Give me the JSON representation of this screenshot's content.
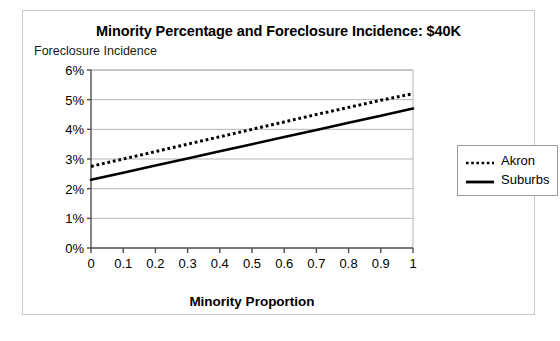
{
  "chart_data": {
    "type": "line",
    "title": "Minority Percentage and Foreclosure Incidence: $40K",
    "xlabel": "Minority Proportion",
    "ylabel": "Foreclosure Incidence",
    "x": [
      0,
      0.1,
      0.2,
      0.3,
      0.4,
      0.5,
      0.6,
      0.7,
      0.8,
      0.9,
      1
    ],
    "xtick_labels": [
      "0",
      "0.1",
      "0.2",
      "0.3",
      "0.4",
      "0.5",
      "0.6",
      "0.7",
      "0.8",
      "0.9",
      "1"
    ],
    "ytick_labels": [
      "0%",
      "1%",
      "2%",
      "3%",
      "4%",
      "5%",
      "6%"
    ],
    "ytick_values": [
      0,
      1,
      2,
      3,
      4,
      5,
      6
    ],
    "xlim": [
      0,
      1
    ],
    "ylim": [
      0,
      6
    ],
    "grid": "horizontal",
    "legend_position": "right-outside",
    "series": [
      {
        "name": "Akron",
        "style": "dotted",
        "color": "#000000",
        "values": [
          2.75,
          3.0,
          3.25,
          3.5,
          3.75,
          4.0,
          4.25,
          4.5,
          4.74,
          4.98,
          5.2
        ]
      },
      {
        "name": "Suburbs",
        "style": "solid",
        "color": "#000000",
        "values": [
          2.3,
          2.54,
          2.78,
          3.02,
          3.26,
          3.5,
          3.74,
          3.98,
          4.22,
          4.46,
          4.7
        ]
      }
    ]
  },
  "colors": {
    "axis": "#4d4d4d",
    "grid": "#b5b5b5",
    "frame": "#c9c9c9",
    "series": "#000000"
  }
}
